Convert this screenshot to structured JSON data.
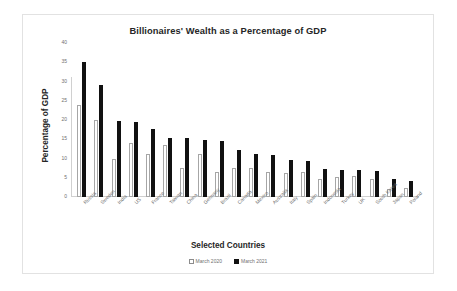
{
  "chart_data": {
    "type": "bar",
    "title": "Billionaires' Wealth as a Percentage of GDP",
    "xlabel": "Selected Countries",
    "ylabel": "Percentage of GDP",
    "ylim": [
      0,
      40
    ],
    "ytick_labels": [
      "40",
      "35",
      "30",
      "25",
      "20",
      "15",
      "10",
      "5",
      "0"
    ],
    "yticks": [
      40,
      35,
      30,
      25,
      20,
      15,
      10,
      5,
      0
    ],
    "grid": false,
    "legend_position": "bottom",
    "categories": [
      "Russia",
      "Sweden",
      "India",
      "US",
      "France",
      "Taiwan",
      "China",
      "Germany",
      "Brazil",
      "Canada",
      "Mexico",
      "Australia",
      "Italy",
      "Spain",
      "Indonesia",
      "Turkey",
      "UK",
      "South Korea",
      "Japan",
      "Poland"
    ],
    "series": [
      {
        "name": "March 2020",
        "color": "#ffffff",
        "values": [
          23.8,
          20.1,
          10.0,
          14.0,
          11.1,
          13.6,
          7.5,
          11.2,
          6.6,
          7.6,
          7.5,
          6.6,
          6.2,
          6.4,
          4.7,
          5.1,
          5.4,
          4.8,
          2.2,
          2.4
        ]
      },
      {
        "name": "March 2021",
        "color": "#111111",
        "values": [
          35.1,
          29.0,
          19.7,
          19.5,
          17.6,
          15.2,
          15.2,
          14.7,
          14.6,
          12.3,
          11.1,
          11.0,
          9.7,
          9.4,
          7.3,
          7.0,
          6.9,
          6.8,
          4.7,
          4.2
        ]
      }
    ]
  }
}
